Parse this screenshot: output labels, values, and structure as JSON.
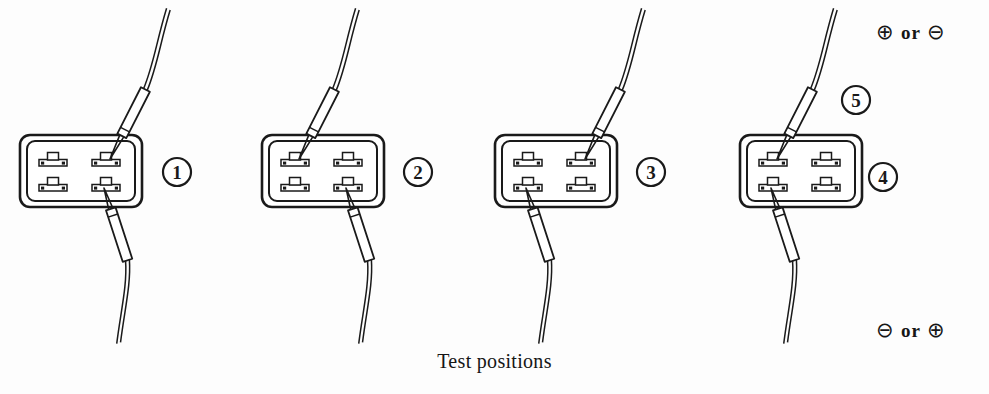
{
  "figure": {
    "caption": "Test positions",
    "kind": "connector-probe-test-position-diagram",
    "connector_count": 4,
    "terminal_layout": "2x2",
    "line_color": "#1a1a1a",
    "background_color": "#fdfdfd"
  },
  "polarity": {
    "top": {
      "first": "⊕",
      "word": "or",
      "second": "⊖"
    },
    "bottom": {
      "first": "⊖",
      "word": "or",
      "second": "⊕"
    }
  },
  "callouts": [
    {
      "id": "callout-1",
      "label": "1",
      "x": 177,
      "y": 172
    },
    {
      "id": "callout-2",
      "label": "2",
      "x": 418,
      "y": 172
    },
    {
      "id": "callout-3",
      "label": "3",
      "x": 651,
      "y": 172
    },
    {
      "id": "callout-4",
      "label": "4",
      "x": 883,
      "y": 177
    },
    {
      "id": "callout-5",
      "label": "5",
      "x": 856,
      "y": 100
    }
  ],
  "connectors": [
    {
      "id": "connector-1",
      "label": "1",
      "x": 20,
      "y": 135,
      "w": 122,
      "h": 72,
      "top_probe_terminal": "top-right",
      "bottom_probe_terminal": "bottom-right"
    },
    {
      "id": "connector-2",
      "label": "2",
      "x": 262,
      "y": 135,
      "w": 122,
      "h": 72,
      "top_probe_terminal": "top-left",
      "bottom_probe_terminal": "bottom-right"
    },
    {
      "id": "connector-3",
      "label": "3",
      "x": 495,
      "y": 135,
      "w": 122,
      "h": 72,
      "top_probe_terminal": "top-right",
      "bottom_probe_terminal": "bottom-left"
    },
    {
      "id": "connector-4",
      "label": "4",
      "x": 740,
      "y": 135,
      "w": 122,
      "h": 72,
      "top_probe_terminal": "top-left",
      "bottom_probe_terminal": "bottom-left"
    }
  ]
}
